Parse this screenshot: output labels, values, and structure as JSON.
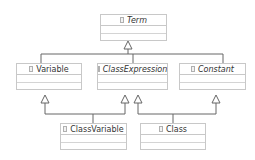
{
  "diagram": {
    "type": "UML class hierarchy",
    "classes": [
      {
        "id": "term",
        "name": "Term",
        "abstract": true
      },
      {
        "id": "variable",
        "name": "Variable",
        "abstract": false
      },
      {
        "id": "class_expression",
        "name": "ClassExpression",
        "abstract": true
      },
      {
        "id": "constant",
        "name": "Constant",
        "abstract": true
      },
      {
        "id": "class_variable",
        "name": "ClassVariable",
        "abstract": false
      },
      {
        "id": "class",
        "name": "Class",
        "abstract": false
      }
    ],
    "generalizations": [
      {
        "from": "Variable",
        "to": "Term"
      },
      {
        "from": "ClassExpression",
        "to": "Term"
      },
      {
        "from": "Constant",
        "to": "Term"
      },
      {
        "from": "ClassVariable",
        "to": "Variable"
      },
      {
        "from": "ClassVariable",
        "to": "ClassExpression"
      },
      {
        "from": "Class",
        "to": "ClassExpression"
      },
      {
        "from": "Class",
        "to": "Constant"
      }
    ],
    "colors": {
      "border": "#c8c8c8",
      "line": "#555555",
      "text": "#333333"
    }
  }
}
